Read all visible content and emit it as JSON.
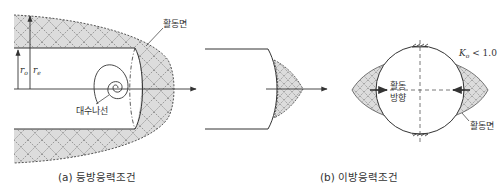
{
  "figure": {
    "panel_a": {
      "caption": "(a) 등방응력조건",
      "labels": {
        "active_surface": "활동면",
        "log_spiral": "대수나선",
        "r_o": "r",
        "r_o_sub": "o",
        "r_e": "r",
        "r_e_sub": "e"
      }
    },
    "panel_middle": {
      "description": "tunnel face with small shaded failure wedge"
    },
    "panel_b": {
      "caption": "(b) 이방응력조건",
      "labels": {
        "k_symbol": "K",
        "k_sub": "o",
        "k_condition": " < 1.0",
        "slip_direction_line1": "활동",
        "slip_direction_line2": "방향",
        "active_surface": "활동면"
      }
    },
    "colors": {
      "line": "#333333",
      "shade": "#dcdcdc",
      "hatch": "#555555"
    }
  }
}
